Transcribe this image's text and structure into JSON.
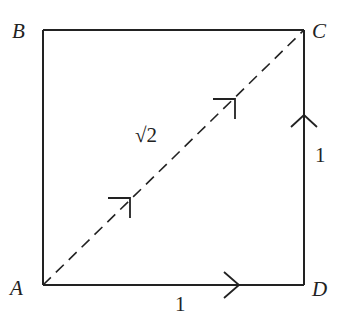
{
  "diagram": {
    "type": "square-with-diagonal",
    "vertices": {
      "A": {
        "label": "A",
        "x": 43,
        "y": 285
      },
      "B": {
        "label": "B",
        "x": 43,
        "y": 30
      },
      "C": {
        "label": "C",
        "x": 304,
        "y": 30
      },
      "D": {
        "label": "D",
        "x": 304,
        "y": 285
      }
    },
    "edges": [
      {
        "from": "A",
        "to": "D",
        "style": "solid",
        "arrow": true,
        "length_label": "1"
      },
      {
        "from": "D",
        "to": "C",
        "style": "solid",
        "arrow": true,
        "length_label": "1"
      },
      {
        "from": "A",
        "to": "C",
        "style": "dashed",
        "arrow": true,
        "arrow_count": 2,
        "length_label": "√2"
      },
      {
        "from": "A",
        "to": "B",
        "style": "solid",
        "arrow": false
      },
      {
        "from": "B",
        "to": "C",
        "style": "solid",
        "arrow": false
      }
    ],
    "labels": {
      "A": "A",
      "B": "B",
      "C": "C",
      "D": "D",
      "bottom_length": "1",
      "right_length": "1",
      "diagonal_length": "√2"
    },
    "colors": {
      "stroke": "#222222",
      "background": "#ffffff"
    }
  }
}
